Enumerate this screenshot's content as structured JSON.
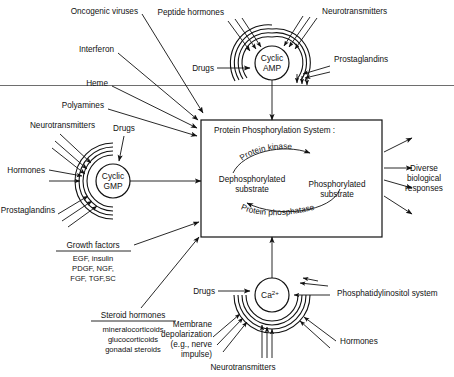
{
  "figure": {
    "membrane_line": "plasma-membrane-line"
  },
  "central_box": {
    "heading": "Protein Phosphorylation System :",
    "left_node": {
      "line1": "Dephosphorylated",
      "line2": "substrate"
    },
    "right_node": {
      "line1": "Phosphorylated",
      "line2": "substrate"
    },
    "top_arrow_label": "Protein kinase",
    "bottom_arrow_label": "Protein phosphatase"
  },
  "second_messengers": [
    {
      "id": "cyclic-amp",
      "line1": "Cyclic",
      "line2": "AMP",
      "inputs": [
        "Peptide hormones",
        "Neurotransmitters",
        "Prostaglandins",
        "Drugs"
      ]
    },
    {
      "id": "cyclic-gmp",
      "line1": "Cyclic",
      "line2": "GMP",
      "inputs": [
        "Neurotransmitters",
        "Drugs",
        "Hormones",
        "Prostaglandins"
      ]
    },
    {
      "id": "calcium",
      "label": "Ca",
      "superscript": "2+",
      "inputs": [
        "Drugs",
        "Phosphatidylinositol system",
        "Membrane depolarization (e.g., nerve impulse)",
        "Hormones",
        "Neurotransmitters"
      ]
    }
  ],
  "top_left_inputs": [
    {
      "label": "Oncogenic viruses"
    },
    {
      "label": "Interferon"
    },
    {
      "label": "Heme"
    },
    {
      "label": "Polyamines"
    }
  ],
  "camp_inputs": {
    "peptide_hormones": "Peptide hormones",
    "neurotransmitters": "Neurotransmitters",
    "prostaglandins": "Prostaglandins",
    "drugs": "Drugs"
  },
  "cgmp_inputs": {
    "neurotransmitters": "Neurotransmitters",
    "drugs": "Drugs",
    "hormones": "Hormones",
    "prostaglandins": "Prostaglandins"
  },
  "calcium_inputs": {
    "drugs": "Drugs",
    "phosphatidylinositol": "Phosphatidylinositol system",
    "hormones": "Hormones",
    "neurotransmitters": "Neurotransmitters",
    "membrane_dep_1": "Membrane",
    "membrane_dep_2": "depolarization",
    "membrane_dep_3": "(e.g., nerve",
    "membrane_dep_4": "impulse)"
  },
  "growth_factors": {
    "heading": "Growth factors",
    "line1": "EGF, insulin",
    "line2": "PDGF, NGF,",
    "line3": "FGF, TGF,SC"
  },
  "steroid_hormones": {
    "heading": "Steroid hormones",
    "line1": "mineralocorticoids",
    "line2": "glucocorticoids",
    "line3": "gonadal steroids"
  },
  "output": {
    "line1": "Diverse",
    "line2": "biological",
    "line3": "responses"
  },
  "colors": {
    "ink": "#111111",
    "membrane": "#6e6e6e",
    "paper": "#ffffff"
  }
}
